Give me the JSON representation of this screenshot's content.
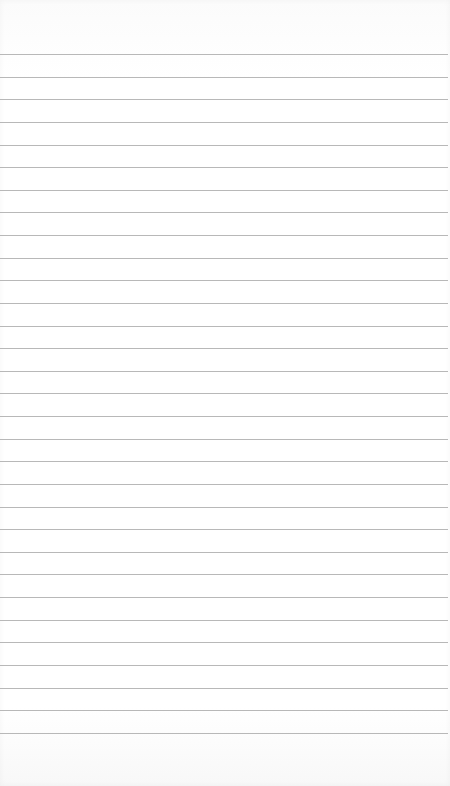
{
  "paper": {
    "background_color": "#fefefe",
    "line_color": "#b8b8b8",
    "first_line_y": 54,
    "line_spacing": 22.63,
    "line_count": 31
  }
}
